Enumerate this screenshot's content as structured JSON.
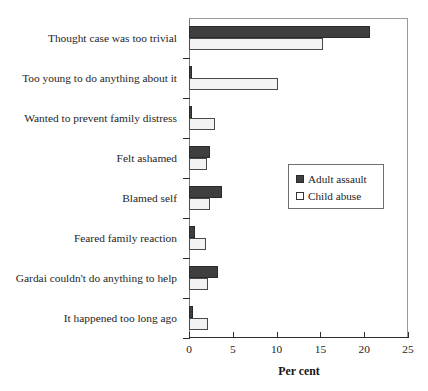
{
  "chart_data": {
    "type": "bar",
    "orientation": "horizontal",
    "title": "",
    "xlabel": "Per cent",
    "ylabel": "",
    "xlim": [
      0,
      25
    ],
    "xticks": [
      0,
      5,
      10,
      15,
      20,
      25
    ],
    "grid": false,
    "legend_position": "center-right",
    "categories": [
      "Thought case was too trivial",
      "Too young to do anything about it",
      "Wanted to prevent family distress",
      "Felt ashamed",
      "Blamed self",
      "Feared family reaction",
      "Gardai couldn't do anything to help",
      "It happened too long ago"
    ],
    "series": [
      {
        "name": "Adult assault",
        "color": "#3f3f3f",
        "values": [
          20.7,
          0.3,
          0.3,
          2.4,
          3.8,
          0.7,
          3.3,
          0.4
        ]
      },
      {
        "name": "Child abuse",
        "color": "#f3f3f3",
        "values": [
          15.3,
          10.2,
          3.0,
          2.1,
          2.4,
          1.9,
          2.2,
          2.2
        ]
      }
    ]
  },
  "axis": {
    "x_title": "Per cent",
    "tick_labels": [
      "0",
      "5",
      "10",
      "15",
      "20",
      "25"
    ]
  },
  "legend": {
    "items": [
      {
        "label": "Adult assault",
        "swatch": "filled-dark-square"
      },
      {
        "label": "Child abuse",
        "swatch": "open-white-square"
      }
    ]
  }
}
